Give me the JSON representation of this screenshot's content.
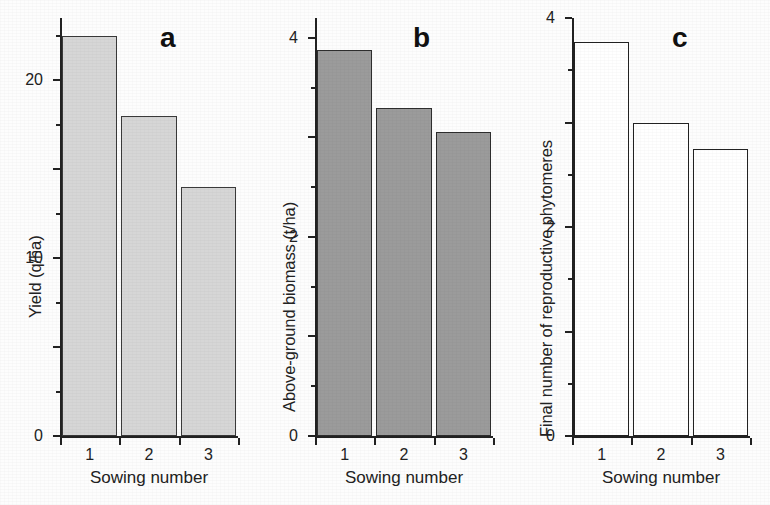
{
  "figure": {
    "background_color": "#fdfdfd",
    "axis_color": "#222222"
  },
  "chart_data": [
    {
      "type": "bar",
      "panel_label": "a",
      "title": "",
      "xlabel": "Sowing number",
      "ylabel": "Yield (q/ha)",
      "categories": [
        "1",
        "2",
        "3"
      ],
      "values": [
        45,
        36,
        28
      ],
      "ylim": [
        0,
        47
      ],
      "yticks": [
        0,
        10,
        20,
        30,
        40
      ],
      "ytick_labels": [
        "0",
        "10",
        "20",
        "30",
        "40"
      ],
      "yminor_ticks": [
        5,
        15,
        25,
        35,
        45
      ],
      "grid": false,
      "legend": "none",
      "bar_fill_color": "#d6d6d6",
      "bar_edge_color": "#3a3a3a"
    },
    {
      "type": "bar",
      "panel_label": "b",
      "title": "",
      "xlabel": "Sowing number",
      "ylabel": "Above-ground biomass (t/ha)",
      "categories": [
        "1",
        "2",
        "3"
      ],
      "values": [
        7.75,
        6.6,
        6.1
      ],
      "ylim": [
        0,
        8.4
      ],
      "yticks": [
        0,
        2,
        4,
        6,
        8
      ],
      "ytick_labels": [
        "0",
        "2",
        "4",
        "6",
        "8"
      ],
      "yminor_ticks": [
        1,
        3,
        5,
        7
      ],
      "grid": false,
      "legend": "none",
      "bar_fill_color": "#9b9b9b",
      "bar_edge_color": "#2e2e2e"
    },
    {
      "type": "bar",
      "panel_label": "c",
      "title": "",
      "xlabel": "Sowing number",
      "ylabel": "Final number of reproductive phytomeres",
      "categories": [
        "1",
        "2",
        "3"
      ],
      "values": [
        7.55,
        6.0,
        5.5
      ],
      "ylim": [
        0,
        8
      ],
      "yticks": [
        0,
        2,
        4,
        6,
        8
      ],
      "ytick_labels": [
        "0",
        "2",
        "4",
        "6",
        "8"
      ],
      "yminor_ticks": [
        1,
        3,
        5,
        7
      ],
      "grid": false,
      "legend": "none",
      "bar_fill_color": "#ffffff",
      "bar_edge_color": "#222222"
    }
  ]
}
